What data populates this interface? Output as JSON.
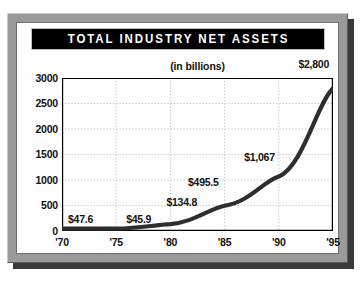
{
  "figure": {
    "title": "TOTAL INDUSTRY NET ASSETS",
    "subtitle": "(in billions)"
  },
  "colors": {
    "title_bar_background": "#000000",
    "title_text": "#ffffff",
    "frame": "#9a9a9a",
    "plot_background": "#ffffff",
    "line": "#2e2e2e",
    "gridline": "#b4b4b4",
    "axis": "#000000",
    "label_text": "#111111"
  },
  "chart_data": {
    "type": "line",
    "title": "TOTAL INDUSTRY NET ASSETS",
    "subtitle": "(in billions)",
    "xlabel": "",
    "ylabel": "",
    "units": "billions of dollars",
    "x": [
      "'70",
      "'75",
      "'80",
      "'85",
      "'90",
      "'95"
    ],
    "x_numeric": [
      1970,
      1975,
      1980,
      1985,
      1990,
      1995
    ],
    "values": [
      47.6,
      45.9,
      134.8,
      495.5,
      1067,
      2800
    ],
    "point_labels": [
      "$47.6",
      "$45.9",
      "$134.8",
      "$495.5",
      "$1,067",
      "$2,800"
    ],
    "xlim": [
      1970,
      1995
    ],
    "ylim": [
      0,
      3000
    ],
    "ytick_labels": [
      "3000",
      "2500",
      "2000",
      "1500",
      "1000",
      "500",
      "0"
    ],
    "ytick_values": [
      3000,
      2500,
      2000,
      1500,
      1000,
      500,
      0
    ],
    "xtick_labels": [
      "'70",
      "'75",
      "'80",
      "'85",
      "'90",
      "'95"
    ],
    "grid": "both-dotted",
    "legend": "none",
    "series": [
      {
        "name": "Total industry net assets",
        "values": [
          47.6,
          45.9,
          134.8,
          495.5,
          1067,
          2800
        ]
      }
    ]
  },
  "axes": {
    "y_ticks": [
      {
        "label": "3000",
        "value": 3000
      },
      {
        "label": "2500",
        "value": 2500
      },
      {
        "label": "2000",
        "value": 2000
      },
      {
        "label": "1500",
        "value": 1500
      },
      {
        "label": "1000",
        "value": 1000
      },
      {
        "label": "500",
        "value": 500
      },
      {
        "label": "0",
        "value": 0
      }
    ],
    "x_ticks": [
      {
        "label": "'70",
        "value": 1970
      },
      {
        "label": "'75",
        "value": 1975
      },
      {
        "label": "'80",
        "value": 1980
      },
      {
        "label": "'85",
        "value": 1985
      },
      {
        "label": "'90",
        "value": 1990
      },
      {
        "label": "'95",
        "value": 1995
      }
    ]
  },
  "point_labels": [
    {
      "text": "$47.6",
      "value": 47.6
    },
    {
      "text": "$45.9",
      "value": 45.9
    },
    {
      "text": "$134.8",
      "value": 134.8
    },
    {
      "text": "$495.5",
      "value": 495.5
    },
    {
      "text": "$1,067",
      "value": 1067
    },
    {
      "text": "$2,800",
      "value": 2800
    }
  ]
}
